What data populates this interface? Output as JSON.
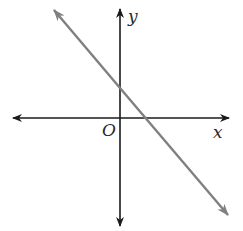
{
  "diagram": {
    "type": "coordinate-plane-line",
    "labels": {
      "x_axis": "x",
      "y_axis": "y",
      "origin": "O"
    },
    "colors": {
      "axes": "#1a1a1a",
      "line": "#808080",
      "labels": "#2a2a2a",
      "background": "#ffffff"
    },
    "line": {
      "description": "Line with negative slope, positive y-intercept and positive x-intercept",
      "slope_sign": "negative",
      "y_intercept_sign": "positive",
      "x_intercept_sign": "positive"
    }
  }
}
